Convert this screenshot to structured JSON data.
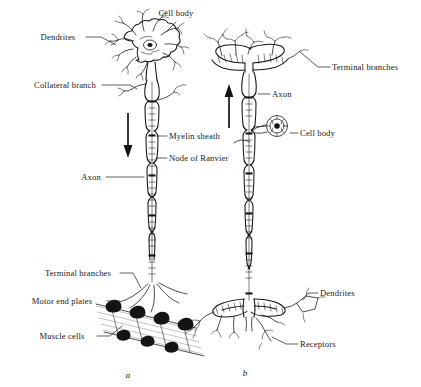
{
  "figure": {
    "background_color": "#ffffff",
    "ink_color": "#141414",
    "muscle_color": "#9a9a9a",
    "width": 421,
    "height": 387
  },
  "panels": [
    {
      "id": "a",
      "caption": "a",
      "type": "motor-neuron",
      "impulse_direction": "down",
      "labels": [
        {
          "key": "cell_body",
          "text": "Cell body",
          "x": 176,
          "y": 16,
          "anchor": "middle"
        },
        {
          "key": "dendrites",
          "text": "Dendrites",
          "x": 58,
          "y": 40,
          "anchor": "middle"
        },
        {
          "key": "collateral_branch",
          "text": "Collateral branch",
          "x": 65,
          "y": 88,
          "anchor": "middle"
        },
        {
          "key": "myelin_sheath",
          "text": "Myelin sheath",
          "x": 169,
          "y": 139,
          "anchor": "start"
        },
        {
          "key": "node_of_ranvier",
          "text": "Node of Ranvier",
          "x": 169,
          "y": 161,
          "anchor": "start"
        },
        {
          "key": "axon",
          "text": "Axon",
          "x": 91,
          "y": 180,
          "anchor": "middle"
        },
        {
          "key": "terminal_branches",
          "text": "Terminal branches",
          "x": 78,
          "y": 276,
          "anchor": "middle"
        },
        {
          "key": "motor_end_plates",
          "text": "Motor end plates",
          "x": 62,
          "y": 304,
          "anchor": "middle"
        },
        {
          "key": "muscle_cells",
          "text": "Muscle cells",
          "x": 62,
          "y": 339,
          "anchor": "middle"
        }
      ]
    },
    {
      "id": "b",
      "caption": "b",
      "type": "sensory-neuron",
      "impulse_direction": "up",
      "labels": [
        {
          "key": "terminal_branches",
          "text": "Terminal branches",
          "x": 332,
          "y": 70,
          "anchor": "start"
        },
        {
          "key": "axon",
          "text": "Axon",
          "x": 272,
          "y": 97,
          "anchor": "start"
        },
        {
          "key": "cell_body",
          "text": "Cell body",
          "x": 300,
          "y": 136,
          "anchor": "start"
        },
        {
          "key": "dendrites",
          "text": "Dendrites",
          "x": 320,
          "y": 296,
          "anchor": "start"
        },
        {
          "key": "receptors",
          "text": "Receptors",
          "x": 300,
          "y": 347,
          "anchor": "start"
        }
      ]
    }
  ]
}
